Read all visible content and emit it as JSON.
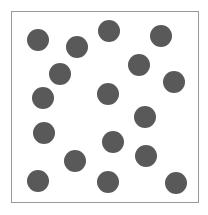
{
  "diagram": {
    "type": "dot-field",
    "frame": {
      "left": 11,
      "top": 11,
      "width": 188,
      "height": 192,
      "border_color": "#9a9a9a"
    },
    "dot_color": "#595959",
    "dot_diameter": 22,
    "dot_count": 17,
    "dots": [
      {
        "x": 38,
        "y": 40
      },
      {
        "x": 77,
        "y": 47
      },
      {
        "x": 109,
        "y": 31
      },
      {
        "x": 161,
        "y": 36
      },
      {
        "x": 60,
        "y": 74
      },
      {
        "x": 139,
        "y": 65
      },
      {
        "x": 174,
        "y": 82
      },
      {
        "x": 43,
        "y": 98
      },
      {
        "x": 108,
        "y": 94
      },
      {
        "x": 145,
        "y": 117
      },
      {
        "x": 44,
        "y": 133
      },
      {
        "x": 113,
        "y": 142
      },
      {
        "x": 146,
        "y": 156
      },
      {
        "x": 75,
        "y": 161
      },
      {
        "x": 38,
        "y": 181
      },
      {
        "x": 108,
        "y": 182
      },
      {
        "x": 176,
        "y": 183
      }
    ]
  }
}
